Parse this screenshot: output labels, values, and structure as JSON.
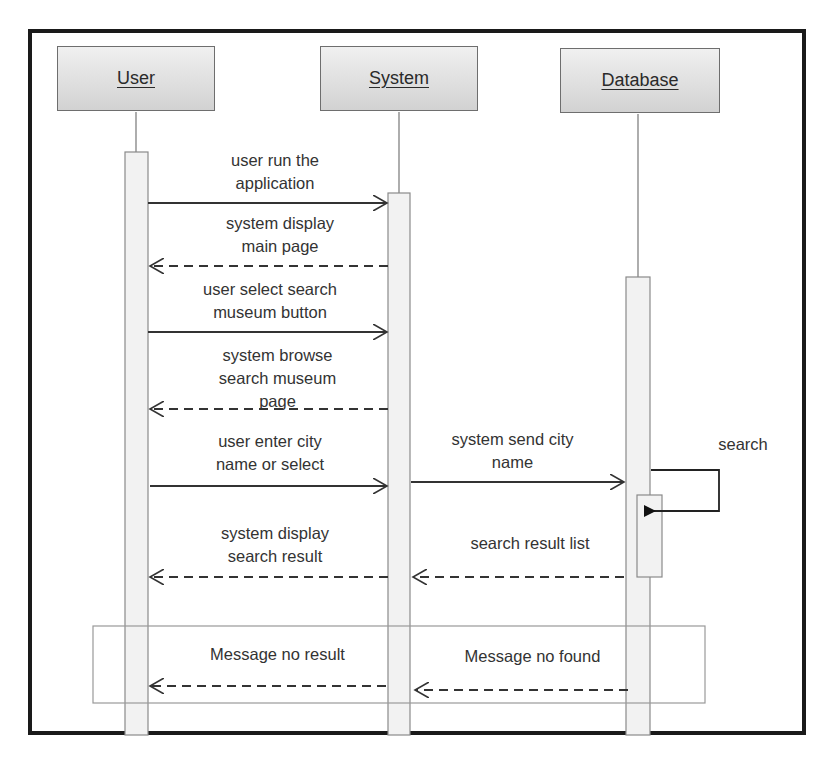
{
  "diagram": {
    "type": "sequence",
    "lifelines": [
      {
        "name": "User"
      },
      {
        "name": "System"
      },
      {
        "name": "Database"
      }
    ],
    "messages": [
      {
        "from": "User",
        "to": "System",
        "style": "solid",
        "lines": [
          "user run the",
          "application"
        ]
      },
      {
        "from": "System",
        "to": "User",
        "style": "dashed",
        "lines": [
          "system display",
          "main page"
        ]
      },
      {
        "from": "User",
        "to": "System",
        "style": "solid",
        "lines": [
          "user select search",
          "museum button"
        ]
      },
      {
        "from": "System",
        "to": "User",
        "style": "dashed",
        "lines": [
          "system browse",
          "search museum",
          "page"
        ]
      },
      {
        "from": "User",
        "to": "System",
        "style": "solid",
        "lines": [
          "user enter city",
          "name or select"
        ]
      },
      {
        "from": "System",
        "to": "Database",
        "style": "solid",
        "lines": [
          "system send city",
          "name"
        ]
      },
      {
        "from": "Database",
        "to": "Database",
        "style": "self",
        "lines": [
          "search"
        ]
      },
      {
        "from": "System",
        "to": "User",
        "style": "dashed",
        "lines": [
          "system display",
          "search result"
        ]
      },
      {
        "from": "Database",
        "to": "System",
        "style": "dashed",
        "lines": [
          "search result list"
        ]
      },
      {
        "from": "System",
        "to": "User",
        "style": "dashed",
        "lines": [
          "Message no result"
        ],
        "fragment": true
      },
      {
        "from": "Database",
        "to": "System",
        "style": "dashed",
        "lines": [
          "Message no found"
        ],
        "fragment": true
      }
    ],
    "colors": {
      "frame": "#1a1a1a",
      "head_top": "#f0f0f0",
      "head_bottom": "#d2d2d2",
      "line": "#333333",
      "activation": "#f2f2f2"
    }
  }
}
